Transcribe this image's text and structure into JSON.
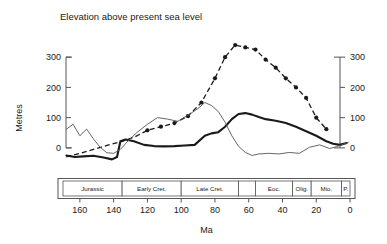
{
  "chart_data": {
    "type": "line",
    "title": "Elevation above present sea level",
    "xlabel": "Ma",
    "ylabel": "Metres",
    "xlim": [
      170,
      0
    ],
    "ylim": [
      -40,
      350
    ],
    "xticks": [
      160,
      140,
      120,
      100,
      80,
      60,
      40,
      20,
      0
    ],
    "xticklabels": [
      "160",
      "140",
      "120",
      "100",
      "80",
      "60",
      "40",
      "20",
      "0"
    ],
    "yticks": [
      0,
      100,
      200,
      300
    ],
    "yticklabels": [
      "0",
      "100",
      "200",
      "300"
    ],
    "y_axis_right": {
      "ticks": [
        0,
        100,
        200,
        300
      ],
      "ticklabels": [
        "0",
        "100",
        "200",
        "300"
      ]
    },
    "grid": false,
    "legend": "none",
    "series": [
      {
        "name": "dashed-with-markers",
        "style": "dashed",
        "markers": true,
        "x": [
          168,
          160,
          152,
          144,
          136,
          128,
          120,
          112,
          104,
          96,
          88,
          80,
          74,
          68,
          62,
          56,
          50,
          44,
          38,
          32,
          26,
          20,
          14
        ],
        "y": [
          -30,
          -18,
          -5,
          8,
          20,
          35,
          58,
          70,
          82,
          105,
          150,
          230,
          300,
          340,
          332,
          325,
          292,
          265,
          230,
          200,
          165,
          100,
          62
        ]
      },
      {
        "name": "thick-solid",
        "style": "solid-thick",
        "markers": false,
        "x": [
          168,
          163,
          158,
          152,
          146,
          141,
          138,
          136,
          133,
          128,
          122,
          116,
          110,
          104,
          98,
          92,
          86,
          82,
          78,
          74,
          70,
          66,
          62,
          58,
          54,
          50,
          44,
          38,
          32,
          26,
          20,
          14,
          10,
          6,
          2
        ],
        "y": [
          -25,
          -30,
          -28,
          -26,
          -32,
          -38,
          -30,
          22,
          28,
          22,
          10,
          6,
          5,
          6,
          8,
          10,
          40,
          48,
          52,
          70,
          95,
          112,
          115,
          110,
          102,
          95,
          90,
          82,
          70,
          55,
          40,
          22,
          14,
          10,
          16
        ]
      },
      {
        "name": "thin-solid",
        "style": "solid-thin",
        "markers": false,
        "x": [
          168,
          164,
          160,
          156,
          152,
          148,
          144,
          140,
          136,
          132,
          126,
          120,
          114,
          108,
          102,
          96,
          90,
          86,
          82,
          78,
          74,
          70,
          66,
          62,
          58,
          54,
          48,
          42,
          36,
          30,
          24,
          18,
          12,
          8,
          4,
          1
        ],
        "y": [
          62,
          78,
          40,
          62,
          30,
          2,
          -16,
          -18,
          -5,
          20,
          52,
          78,
          100,
          95,
          88,
          108,
          130,
          150,
          140,
          120,
          85,
          40,
          5,
          -15,
          -25,
          -20,
          -18,
          -20,
          -15,
          -18,
          2,
          10,
          -2,
          4,
          12,
          18
        ]
      }
    ],
    "timescale": {
      "axis_label": "Ma",
      "segments": [
        {
          "label": "Jurassic",
          "start": 170,
          "end": 135
        },
        {
          "label": "Early Cret.",
          "start": 135,
          "end": 100
        },
        {
          "label": "Late Cret.",
          "start": 100,
          "end": 66
        },
        {
          "label": "",
          "start": 66,
          "end": 56
        },
        {
          "label": "Eoc.",
          "start": 56,
          "end": 34
        },
        {
          "label": "Olig.",
          "start": 34,
          "end": 23
        },
        {
          "label": "Mio.",
          "start": 23,
          "end": 5
        },
        {
          "label": "P.",
          "start": 5,
          "end": 0
        }
      ]
    }
  }
}
